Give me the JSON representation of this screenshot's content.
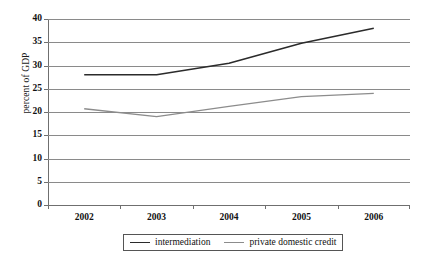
{
  "chart_data": {
    "type": "line",
    "title": "",
    "subtitle": "",
    "xlabel": "",
    "ylabel": "percent of GDP",
    "categories": [
      "2002",
      "2003",
      "2004",
      "2005",
      "2006"
    ],
    "x": [
      2002,
      2003,
      2004,
      2005,
      2006
    ],
    "series": [
      {
        "name": "intermediation",
        "values": [
          28.0,
          28.0,
          30.5,
          34.8,
          38.0
        ],
        "color": "#2b2b2b",
        "width": 1.6
      },
      {
        "name": "private domestic credit",
        "values": [
          20.7,
          19.0,
          21.2,
          23.3,
          24.0
        ],
        "color": "#8c8c8c",
        "width": 1.3
      }
    ],
    "ylim": [
      0,
      40
    ],
    "ytick_step": 5,
    "yticks": [
      "0",
      "5",
      "10",
      "15",
      "20",
      "25",
      "30",
      "35",
      "40"
    ],
    "grid": true,
    "grid_axis": "y",
    "legend_position": "bottom-center",
    "axis_color": "#6f6f6f",
    "grid_color": "#8a8a8a",
    "background": "#ffffff"
  },
  "legend": {
    "items": [
      {
        "label": "intermediation"
      },
      {
        "label": "private domestic credit"
      }
    ]
  }
}
